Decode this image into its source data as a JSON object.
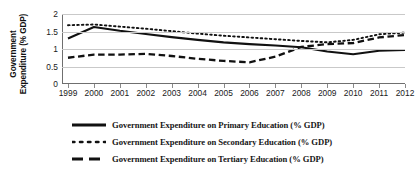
{
  "chart_data": {
    "type": "line",
    "title": "",
    "xlabel": "",
    "ylabel": "Government Expenditure (% GDP)",
    "ylabel_lines": [
      "Government",
      "Expenditure (% GDP)"
    ],
    "categories": [
      1999,
      2000,
      2001,
      2002,
      2003,
      2004,
      2005,
      2006,
      2007,
      2008,
      2009,
      2010,
      2011,
      2012
    ],
    "x_tick_labels": [
      "1999",
      "2000",
      "2001",
      "2002",
      "2003",
      "2004",
      "2005",
      "2006",
      "2007",
      "2008",
      "2009",
      "2010",
      "2011",
      "2012"
    ],
    "y_tick_labels": [
      "0",
      "0.5",
      "1",
      "1.5",
      "2"
    ],
    "y_tick_values": [
      0,
      0.5,
      1,
      1.5,
      2
    ],
    "ylim": [
      0,
      2
    ],
    "grid": true,
    "grid_axis": "y",
    "legend_position": "bottom",
    "series": [
      {
        "name": "Government Expenditure on Primary Education (% GDP)",
        "short_name": "Primary",
        "style": "solid",
        "color": "#111111",
        "values": [
          1.3,
          1.63,
          1.52,
          1.43,
          1.34,
          1.26,
          1.19,
          1.14,
          1.1,
          1.05,
          0.93,
          0.85,
          0.95,
          0.97
        ]
      },
      {
        "name": "Government Expenditure on Secondary Education (% GDP)",
        "short_name": "Secondary",
        "style": "dotted",
        "color": "#111111",
        "values": [
          1.68,
          1.7,
          1.64,
          1.58,
          1.51,
          1.44,
          1.38,
          1.33,
          1.28,
          1.23,
          1.19,
          1.26,
          1.42,
          1.47
        ]
      },
      {
        "name": "Government Expenditure on Tertiary Education (% GDP)",
        "short_name": "Tertiary",
        "style": "dashed",
        "color": "#111111",
        "values": [
          0.75,
          0.84,
          0.84,
          0.86,
          0.8,
          0.72,
          0.66,
          0.62,
          0.78,
          1.06,
          1.14,
          1.17,
          1.33,
          1.4
        ]
      }
    ]
  },
  "legend": {
    "items": [
      {
        "label": "Government Expenditure on Primary Education (% GDP)",
        "style": "solid"
      },
      {
        "label": "Government Expenditure on Secondary Education (% GDP)",
        "style": "dotted"
      },
      {
        "label": "Government Expenditure on Tertiary Education (% GDP)",
        "style": "dashed"
      }
    ]
  }
}
